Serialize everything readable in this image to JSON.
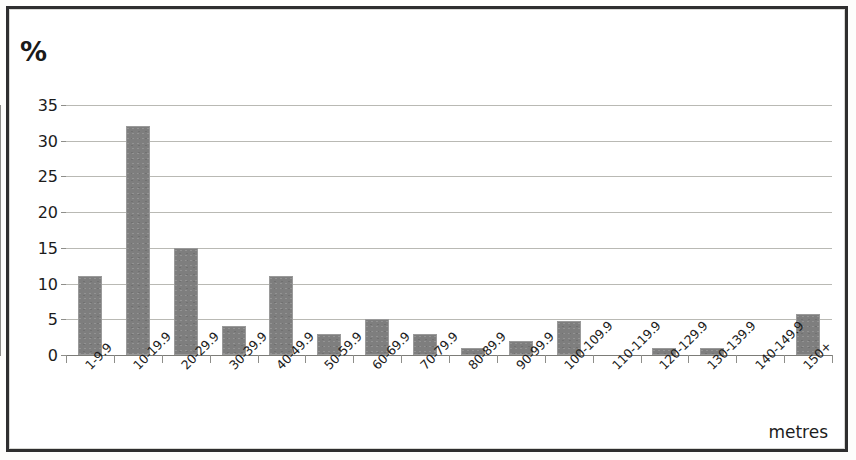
{
  "chart_data": {
    "type": "bar",
    "title": "",
    "xlabel": "metres",
    "ylabel": "%",
    "ylim": [
      0,
      35
    ],
    "yticks": [
      0,
      5,
      10,
      15,
      20,
      25,
      30,
      35
    ],
    "ytick_labels": [
      "0",
      "5",
      "10",
      "15",
      "20",
      "25",
      "30",
      "35"
    ],
    "grid": true,
    "legend": "none",
    "bar_color": "#7e7e7e",
    "categories": [
      "1-9.9",
      "10-19.9",
      "20-29.9",
      "30-39.9",
      "40-49.9",
      "50-59.9",
      "60-69.9",
      "70-79.9",
      "80-89.9",
      "90-99.9",
      "100-109.9",
      "110-119.9",
      "120-129.9",
      "130-139.9",
      "140-149.9",
      "150+"
    ],
    "values": [
      11,
      32,
      15,
      4,
      11,
      3,
      5,
      3,
      1,
      2,
      4.8,
      0,
      1,
      1,
      0,
      5.7
    ]
  }
}
